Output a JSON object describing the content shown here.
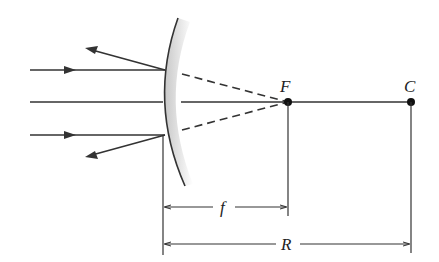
{
  "diagram": {
    "type": "convex-mirror-ray-diagram",
    "labels": {
      "focal_point": "F",
      "center_of_curvature": "C",
      "focal_length": "f",
      "radius": "R"
    },
    "colors": {
      "line": "#333333",
      "mirror_shade": "#cfcfcf",
      "background": "#ffffff"
    }
  }
}
